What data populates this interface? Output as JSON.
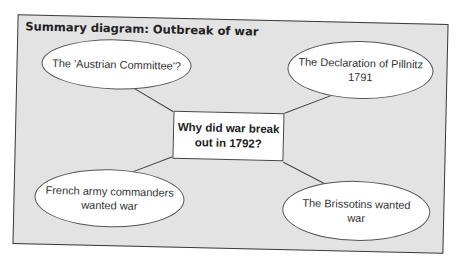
{
  "diagram": {
    "title": "Summary diagram: Outbreak of war",
    "center": {
      "line1": "Why did war break",
      "line2": "out in 1792?"
    },
    "nodes": [
      {
        "id": "austrian-committee",
        "line1": "The 'Austrian Committee'?",
        "line2": ""
      },
      {
        "id": "declaration-pillnitz",
        "line1": "The Declaration of Pillnitz",
        "line2": "1791"
      },
      {
        "id": "army-commanders",
        "line1": "French army commanders",
        "line2": "wanted war"
      },
      {
        "id": "brissotins",
        "line1": "The Brissotins wanted",
        "line2": "war"
      }
    ],
    "colors": {
      "panel_fill": "#e3e3e3",
      "border": "#3a3a3a",
      "node_fill": "#ffffff"
    }
  }
}
